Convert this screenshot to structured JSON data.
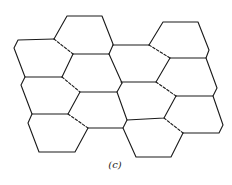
{
  "figure": {
    "caption": "(c)",
    "line_color": "#1a1a1a",
    "background": "#ffffff"
  },
  "edges": {
    "solid": [
      [
        [
          67,
          16
        ],
        [
          102,
          16
        ]
      ],
      [
        [
          102,
          16
        ],
        [
          113,
          44
        ]
      ],
      [
        [
          67,
          16
        ],
        [
          54,
          39
        ]
      ],
      [
        [
          54,
          39
        ],
        [
          18,
          40
        ]
      ],
      [
        [
          18,
          40
        ],
        [
          14,
          48
        ]
      ],
      [
        [
          14,
          48
        ],
        [
          25,
          77
        ]
      ],
      [
        [
          25,
          77
        ],
        [
          62,
          77
        ]
      ],
      [
        [
          54,
          39
        ],
        [
          73,
          54
        ]
      ],
      [
        [
          73,
          54
        ],
        [
          109,
          54
        ]
      ],
      [
        [
          73,
          54
        ],
        [
          62,
          77
        ]
      ],
      [
        [
          109,
          54
        ],
        [
          113,
          45
        ]
      ],
      [
        [
          113,
          45
        ],
        [
          150,
          45
        ]
      ],
      [
        [
          109,
          54
        ],
        [
          122,
          83
        ]
      ],
      [
        [
          113,
          44
        ],
        [
          113,
          45
        ]
      ],
      [
        [
          163,
          22
        ],
        [
          198,
          22
        ]
      ],
      [
        [
          198,
          22
        ],
        [
          209,
          50
        ]
      ],
      [
        [
          209,
          50
        ],
        [
          206,
          58
        ]
      ],
      [
        [
          206,
          58
        ],
        [
          170,
          58
        ]
      ],
      [
        [
          163,
          22
        ],
        [
          149,
          45
        ]
      ],
      [
        [
          149,
          45
        ],
        [
          150,
          45
        ]
      ],
      [
        [
          170,
          58
        ],
        [
          156,
          82
        ]
      ],
      [
        [
          206,
          58
        ],
        [
          217,
          88
        ]
      ],
      [
        [
          217,
          88
        ],
        [
          213,
          96
        ]
      ],
      [
        [
          213,
          96
        ],
        [
          176,
          96
        ]
      ],
      [
        [
          156,
          82
        ],
        [
          121,
          82
        ]
      ],
      [
        [
          121,
          82
        ],
        [
          122,
          83
        ]
      ],
      [
        [
          24,
          77
        ],
        [
          21,
          85
        ]
      ],
      [
        [
          21,
          85
        ],
        [
          32,
          114
        ]
      ],
      [
        [
          32,
          114
        ],
        [
          68,
          114
        ]
      ],
      [
        [
          68,
          114
        ],
        [
          80,
          92
        ]
      ],
      [
        [
          80,
          92
        ],
        [
          117,
          92
        ]
      ],
      [
        [
          117,
          92
        ],
        [
          122,
          83
        ]
      ],
      [
        [
          117,
          92
        ],
        [
          127,
          120
        ]
      ],
      [
        [
          127,
          120
        ],
        [
          164,
          118
        ]
      ],
      [
        [
          176,
          96
        ],
        [
          164,
          118
        ]
      ],
      [
        [
          213,
          96
        ],
        [
          223,
          125
        ]
      ],
      [
        [
          223,
          125
        ],
        [
          219,
          133
        ]
      ],
      [
        [
          219,
          133
        ],
        [
          183,
          133
        ]
      ],
      [
        [
          183,
          133
        ],
        [
          171,
          157
        ]
      ],
      [
        [
          171,
          157
        ],
        [
          136,
          157
        ]
      ],
      [
        [
          136,
          157
        ],
        [
          123,
          128
        ]
      ],
      [
        [
          123,
          128
        ],
        [
          127,
          120
        ]
      ],
      [
        [
          32,
          114
        ],
        [
          28,
          123
        ]
      ],
      [
        [
          28,
          123
        ],
        [
          39,
          152
        ]
      ],
      [
        [
          39,
          152
        ],
        [
          75,
          152
        ]
      ],
      [
        [
          75,
          152
        ],
        [
          88,
          128
        ]
      ],
      [
        [
          88,
          128
        ],
        [
          127,
          128
        ]
      ],
      [
        [
          128,
          120
        ],
        [
          163,
          120
        ]
      ]
    ],
    "dashed": [
      [
        [
          54,
          39
        ],
        [
          73,
          54
        ]
      ],
      [
        [
          149,
          45
        ],
        [
          170,
          58
        ]
      ],
      [
        [
          62,
          77
        ],
        [
          80,
          92
        ]
      ],
      [
        [
          156,
          82
        ],
        [
          176,
          96
        ]
      ],
      [
        [
          68,
          114
        ],
        [
          88,
          128
        ]
      ],
      [
        [
          164,
          118
        ],
        [
          183,
          133
        ]
      ]
    ]
  },
  "cells": [
    {
      "id": "r1c1",
      "points": "67,16 102,16 113,44 109,54 73,54 54,39"
    },
    {
      "id": "r1c2",
      "points": "163,22 198,22 209,50 206,58 170,58 149,45"
    },
    {
      "id": "r2c1",
      "points": "18,40 54,39 73,54 62,77 25,77 14,48"
    },
    {
      "id": "r2c2",
      "points": "73,54 109,54 122,83 117,92 80,92 62,77"
    },
    {
      "id": "r2c3",
      "points": "113,45 149,45 170,58 156,82 121,82 109,54"
    },
    {
      "id": "r2c4",
      "points": "170,58 206,58 217,88 213,96 176,96 156,82"
    },
    {
      "id": "r3c1",
      "points": "25,77 62,77 80,92 68,114 32,114 21,85"
    },
    {
      "id": "r3c2",
      "points": "121,82 156,82 176,96 164,118 127,120 117,92"
    },
    {
      "id": "r3c3",
      "points": "176,96 213,96 223,125 219,133 183,133 164,118"
    },
    {
      "id": "r4c1",
      "points": "32,114 68,114 88,128 75,152 39,152 28,123"
    },
    {
      "id": "r4c2",
      "points": "80,92 117,92 127,120 123,128 88,128 68,114"
    },
    {
      "id": "r4c3",
      "points": "127,120 164,118 183,133 171,157 136,157 123,128"
    }
  ]
}
